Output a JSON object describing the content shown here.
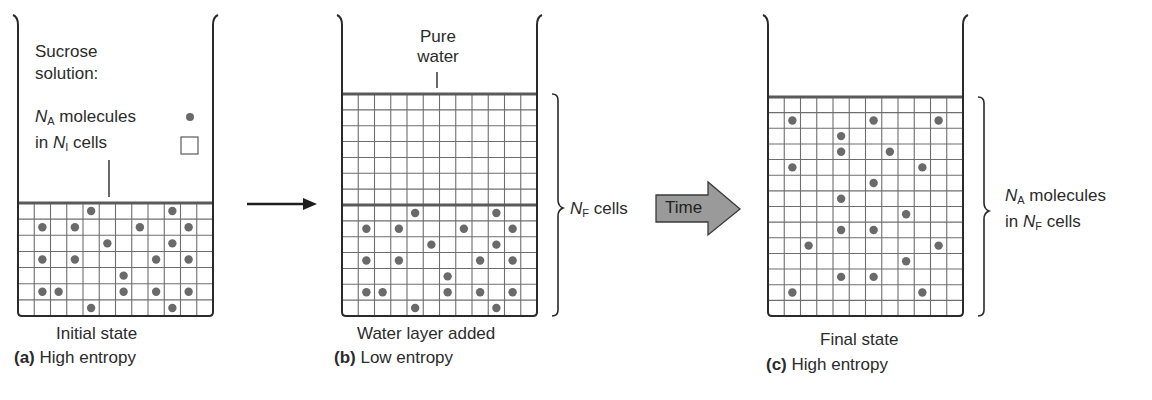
{
  "colors": {
    "outline": "#2a2a2a",
    "grid": "#6e6e6e",
    "grid_heavy": "#5a5a5a",
    "molecule": "#6a6a6a",
    "time_arrow_fill": "#9a9a9a",
    "text": "#2b2b2b"
  },
  "panels": [
    {
      "id": "a",
      "legend": {
        "line1": "Sucrose",
        "line2": "solution:",
        "molecules_symbol": "N",
        "molecules_sub": "A",
        "molecules_text": " molecules",
        "cells_prefix": "in ",
        "cells_symbol": "N",
        "cells_sub": "I",
        "cells_text": " cells",
        "molecule_icon": "filled-dot",
        "cell_icon": "empty-square"
      },
      "state_label": "Initial state",
      "caption_letter": "(a)",
      "caption_text": " High entropy",
      "grid": {
        "cols": 12,
        "rows": 7
      },
      "molecules": [
        [
          0,
          4
        ],
        [
          0,
          9
        ],
        [
          1,
          1
        ],
        [
          1,
          3
        ],
        [
          1,
          7
        ],
        [
          1,
          10
        ],
        [
          2,
          5
        ],
        [
          2,
          9
        ],
        [
          3,
          1
        ],
        [
          3,
          3
        ],
        [
          3,
          8
        ],
        [
          3,
          10
        ],
        [
          4,
          6
        ],
        [
          5,
          1
        ],
        [
          5,
          2
        ],
        [
          5,
          6
        ],
        [
          5,
          8
        ],
        [
          5,
          10
        ],
        [
          6,
          4
        ],
        [
          6,
          9
        ]
      ]
    },
    {
      "id": "b",
      "top_label_line1": "Pure",
      "top_label_line2": "water",
      "brace_symbol": "N",
      "brace_sub": "F",
      "brace_text": " cells",
      "state_label": "Water layer added",
      "caption_letter": "(b)",
      "caption_text": " Low entropy",
      "grid": {
        "cols": 12,
        "rows": 14,
        "water_rows": 7
      },
      "molecules": [
        [
          7,
          4
        ],
        [
          7,
          9
        ],
        [
          8,
          1
        ],
        [
          8,
          3
        ],
        [
          8,
          7
        ],
        [
          8,
          10
        ],
        [
          9,
          5
        ],
        [
          9,
          9
        ],
        [
          10,
          1
        ],
        [
          10,
          3
        ],
        [
          10,
          8
        ],
        [
          10,
          10
        ],
        [
          11,
          6
        ],
        [
          12,
          1
        ],
        [
          12,
          2
        ],
        [
          12,
          6
        ],
        [
          12,
          8
        ],
        [
          12,
          10
        ],
        [
          13,
          4
        ],
        [
          13,
          9
        ]
      ]
    },
    {
      "id": "c",
      "brace_line1_symbol": "N",
      "brace_line1_sub": "A",
      "brace_line1_text": " molecules",
      "brace_line2_prefix": "in ",
      "brace_line2_symbol": "N",
      "brace_line2_sub": "F",
      "brace_line2_text": " cells",
      "state_label": "Final state",
      "caption_letter": "(c)",
      "caption_text": " High entropy",
      "grid": {
        "cols": 12,
        "rows": 14
      },
      "molecules": [
        [
          1,
          1
        ],
        [
          1,
          6
        ],
        [
          1,
          10
        ],
        [
          2,
          4
        ],
        [
          3,
          4
        ],
        [
          3,
          7
        ],
        [
          4,
          1
        ],
        [
          4,
          9
        ],
        [
          5,
          6
        ],
        [
          6,
          4
        ],
        [
          7,
          8
        ],
        [
          8,
          4
        ],
        [
          8,
          6
        ],
        [
          9,
          2
        ],
        [
          9,
          10
        ],
        [
          10,
          8
        ],
        [
          11,
          4
        ],
        [
          11,
          6
        ],
        [
          12,
          1
        ],
        [
          12,
          9
        ]
      ]
    }
  ],
  "transitions": {
    "a_to_b": "arrow-right",
    "b_to_c_label": "Time"
  }
}
